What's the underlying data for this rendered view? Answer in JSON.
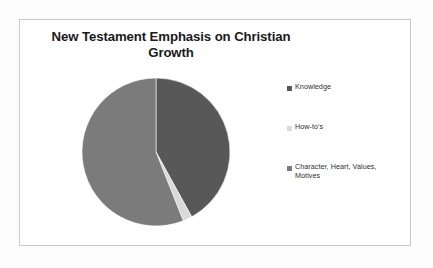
{
  "slide": {
    "title_line_1": "New Testament Emphasis on Christian",
    "title_line_2": "Growth",
    "title_full": "New Testament Emphasis on Christian Growth",
    "frame_color": "#c9c9c9",
    "background_color": "#ffffff"
  },
  "chart_data": {
    "type": "pie",
    "title": "New Testament Emphasis on Christian Growth",
    "xlabel": "",
    "ylabel": "",
    "legend_position": "right",
    "grid": false,
    "categories": [
      "Knowledge",
      "How-to's",
      "Character, Heart, Values, Motives"
    ],
    "values": [
      42,
      2,
      56
    ],
    "slices": [
      {
        "label": "Knowledge",
        "value": 42,
        "color": "#585858",
        "start_angle_deg": 0,
        "end_angle_deg": 151.2
      },
      {
        "label": "How-to's",
        "value": 2,
        "color": "#d9d9d9",
        "start_angle_deg": 151.2,
        "end_angle_deg": 158.4
      },
      {
        "label": "Character, Heart, Values, Motives",
        "value": 56,
        "color": "#7b7b7b",
        "start_angle_deg": 158.4,
        "end_angle_deg": 360
      }
    ]
  },
  "legend": {
    "items": [
      {
        "label": "Knowledge",
        "color": "#585858"
      },
      {
        "label": "How-to's",
        "color": "#d9d9d9"
      },
      {
        "label": "Character, Heart, Values,",
        "label_line_2": "Motives",
        "color": "#7b7b7b"
      }
    ]
  }
}
